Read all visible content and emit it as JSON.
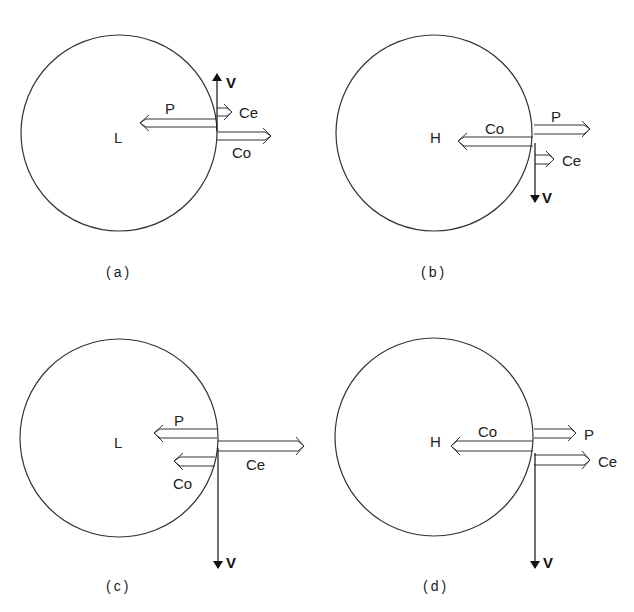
{
  "figure": {
    "panels": [
      {
        "id": "a",
        "caption": "(a)",
        "center_label": "L",
        "arrows": [
          {
            "label": "P",
            "direction": "left",
            "relative_length": "long"
          },
          {
            "label": "Ce",
            "direction": "right",
            "relative_length": "short"
          },
          {
            "label": "Co",
            "direction": "right",
            "relative_length": "medium"
          }
        ],
        "velocity": {
          "label": "V",
          "direction": "up"
        }
      },
      {
        "id": "b",
        "caption": "(b)",
        "center_label": "H",
        "arrows": [
          {
            "label": "Co",
            "direction": "left",
            "relative_length": "long"
          },
          {
            "label": "P",
            "direction": "right",
            "relative_length": "medium"
          },
          {
            "label": "Ce",
            "direction": "right",
            "relative_length": "short"
          }
        ],
        "velocity": {
          "label": "V",
          "direction": "down"
        }
      },
      {
        "id": "c",
        "caption": "(c)",
        "center_label": "L",
        "arrows": [
          {
            "label": "P",
            "direction": "left",
            "relative_length": "medium"
          },
          {
            "label": "Ce",
            "direction": "right",
            "relative_length": "long"
          },
          {
            "label": "Co",
            "direction": "left",
            "relative_length": "short"
          }
        ],
        "velocity": {
          "label": "V",
          "direction": "down"
        }
      },
      {
        "id": "d",
        "caption": "(d)",
        "center_label": "H",
        "arrows": [
          {
            "label": "Co",
            "direction": "left",
            "relative_length": "long"
          },
          {
            "label": "P",
            "direction": "right",
            "relative_length": "short"
          },
          {
            "label": "Ce",
            "direction": "right",
            "relative_length": "medium"
          }
        ],
        "velocity": {
          "label": "V",
          "direction": "down"
        }
      }
    ]
  },
  "colors": {
    "stroke": "#333333",
    "background": "#ffffff"
  }
}
